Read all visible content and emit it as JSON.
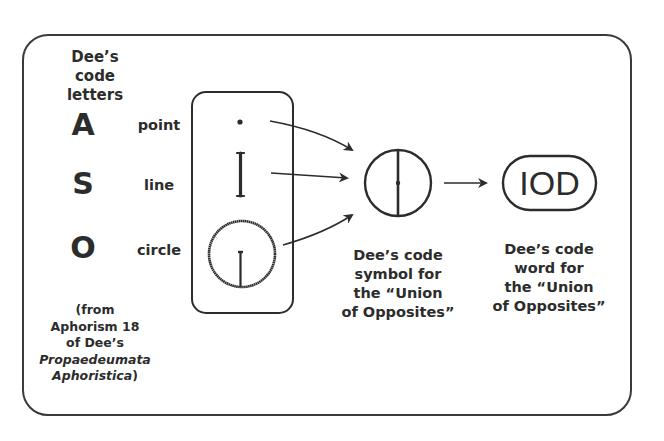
{
  "diagram": {
    "heading": [
      "Dee’s",
      "code",
      "letters"
    ],
    "rows": [
      {
        "letter": "A",
        "word": "point",
        "symbol": "dot"
      },
      {
        "letter": "S",
        "word": "line",
        "symbol": "vertical-line"
      },
      {
        "letter": "O",
        "word": "circle",
        "symbol": "circle-with-line"
      }
    ],
    "source_note": {
      "lines": [
        "(from",
        "Aphorism 18",
        "of Dee’s"
      ],
      "title_italic_1": "Propaedeumata",
      "title_italic_2": "Aphoristica",
      "close": ")"
    },
    "symbol_caption": [
      "Dee’s code",
      "symbol for",
      "the “Union",
      "of Opposites”"
    ],
    "word_label": "IOD",
    "word_caption": [
      "Dee’s code",
      "word for",
      "the “Union",
      "of Opposites”"
    ],
    "colors": {
      "stroke": "#2c2c2c",
      "frame": "#3a3a3a",
      "background": "#ffffff"
    }
  }
}
